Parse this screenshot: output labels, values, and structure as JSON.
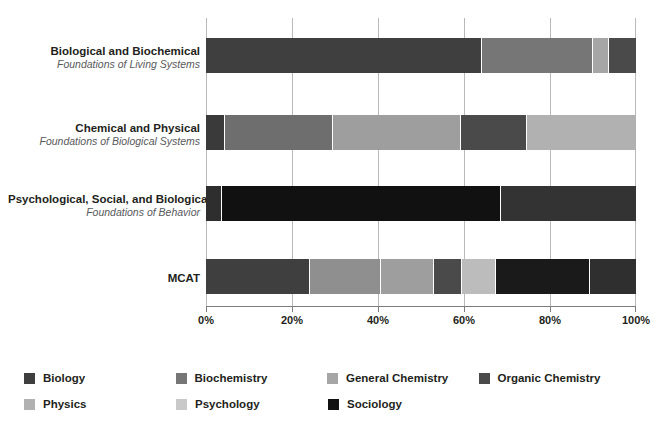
{
  "chart_data": {
    "type": "bar",
    "orientation": "horizontal",
    "stacked": true,
    "normalized": true,
    "title": "",
    "xlabel": "",
    "ylabel": "",
    "xlim": [
      0,
      100
    ],
    "grid": true,
    "legend_position": "bottom",
    "x_ticks": [
      "0%",
      "20%",
      "40%",
      "60%",
      "80%",
      "100%"
    ],
    "x_tick_values": [
      0,
      20,
      40,
      60,
      80,
      100
    ],
    "categories": [
      {
        "line1": "Biological and Biochemical",
        "line2": "Foundations of Living Systems"
      },
      {
        "line1": "Chemical and Physical",
        "line2": "Foundations of Biological Systems"
      },
      {
        "line1": "Psychological, Social, and Biological",
        "line2": "Foundations of Behavior"
      },
      {
        "line1": "MCAT",
        "line2": ""
      }
    ],
    "series": [
      {
        "name": "Biology",
        "color": "#3f3f3f"
      },
      {
        "name": "Biochemistry",
        "color": "#6e6e6e"
      },
      {
        "name": "General Chemistry",
        "color": "#9a9a9a"
      },
      {
        "name": "Organic Chemistry",
        "color": "#4a4a4a"
      },
      {
        "name": "Physics",
        "color": "#ababab"
      },
      {
        "name": "Psychology",
        "color": "#c4c4c4"
      },
      {
        "name": "Sociology",
        "color": "#111111"
      }
    ],
    "bars": [
      {
        "category": "Biological and Biochemical Foundations of Living Systems",
        "segments": [
          {
            "series": "Biology",
            "value": 64.2,
            "color": "#3f3f3f"
          },
          {
            "series": "Biochemistry",
            "value": 25.8,
            "color": "#767676"
          },
          {
            "series": "General Chemistry",
            "value": 3.7,
            "color": "#a6a6a6"
          },
          {
            "series": "Organic Chemistry",
            "value": 6.3,
            "color": "#4a4a4a"
          }
        ]
      },
      {
        "category": "Chemical and Physical Foundations of Biological Systems",
        "segments": [
          {
            "series": "Biochemistry",
            "value": 4.4,
            "color": "#3a3a3a"
          },
          {
            "series": "Biology",
            "value": 25.1,
            "color": "#6e6e6e"
          },
          {
            "series": "General Chemistry",
            "value": 29.8,
            "color": "#9e9e9e"
          },
          {
            "series": "Organic Chemistry",
            "value": 15.3,
            "color": "#4a4a4a"
          },
          {
            "series": "Physics",
            "value": 25.4,
            "color": "#b1b1b1"
          }
        ]
      },
      {
        "category": "Psychological, Social, and Biological Foundations of Behavior",
        "segments": [
          {
            "series": "Biology",
            "value": 3.7,
            "color": "#2e2e2e"
          },
          {
            "series": "Sociology",
            "value": 64.9,
            "color": "#111111"
          },
          {
            "series": "Psychology",
            "value": 31.4,
            "color": "#333333"
          }
        ]
      },
      {
        "category": "MCAT",
        "segments": [
          {
            "series": "Biology",
            "value": 24.2,
            "color": "#3f3f3f"
          },
          {
            "series": "Biochemistry",
            "value": 16.5,
            "color": "#8f8f8f"
          },
          {
            "series": "General Chemistry",
            "value": 12.3,
            "color": "#9e9e9e"
          },
          {
            "series": "Organic Chemistry",
            "value": 6.5,
            "color": "#4a4a4a"
          },
          {
            "series": "Physics",
            "value": 7.9,
            "color": "#bcbcbc"
          },
          {
            "series": "Psychology",
            "value": 21.9,
            "color": "#1a1a1a"
          },
          {
            "series": "Sociology",
            "value": 10.7,
            "color": "#2f2f2f"
          }
        ]
      }
    ]
  },
  "legend": {
    "rows": [
      [
        {
          "label": "Biology",
          "color": "#3f3f3f"
        },
        {
          "label": "Biochemistry",
          "color": "#767676"
        },
        {
          "label": "General Chemistry",
          "color": "#a6a6a6"
        },
        {
          "label": "Organic Chemistry",
          "color": "#4a4a4a"
        }
      ],
      [
        {
          "label": "Physics",
          "color": "#b1b1b1"
        },
        {
          "label": "Psychology",
          "color": "#c9c9c9"
        },
        {
          "label": "Sociology",
          "color": "#111111"
        }
      ]
    ]
  }
}
